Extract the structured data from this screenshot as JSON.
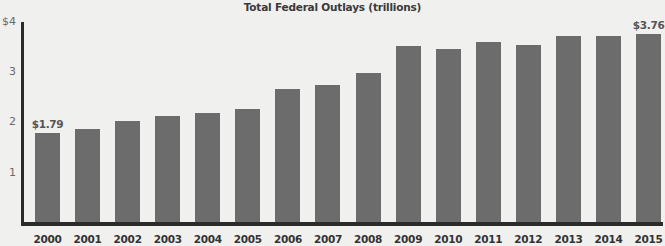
{
  "chart_data": {
    "type": "bar",
    "title": "Total Federal Outlays (trillions)",
    "xlabel": "",
    "ylabel": "",
    "ylim": [
      0,
      4
    ],
    "yticks": [
      {
        "value": 1,
        "label": "1"
      },
      {
        "value": 2,
        "label": "2"
      },
      {
        "value": 3,
        "label": "3"
      },
      {
        "value": 4,
        "label": "$4"
      }
    ],
    "grid": false,
    "legend": null,
    "categories": [
      "2000",
      "2001",
      "2002",
      "2003",
      "2004",
      "2005",
      "2006",
      "2007",
      "2008",
      "2009",
      "2010",
      "2011",
      "2012",
      "2013",
      "2014",
      "2015"
    ],
    "values": [
      1.79,
      1.86,
      2.02,
      2.13,
      2.19,
      2.27,
      2.66,
      2.74,
      2.98,
      3.52,
      3.46,
      3.6,
      3.54,
      3.71,
      3.71,
      3.76
    ],
    "annotations": [
      {
        "category": "2000",
        "label": "$1.79"
      },
      {
        "category": "2015",
        "label": "$3.76"
      }
    ],
    "colors": {
      "bar": "#6c6c6c",
      "axis": "#2b2b2b",
      "background": "#f0f0ef"
    }
  }
}
